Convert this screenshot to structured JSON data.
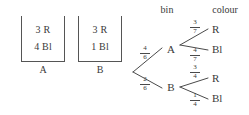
{
  "figure": {
    "type": "probability-tree-with-bins",
    "background": "#ffffff",
    "ink": "#3a3a3a"
  },
  "bins": [
    {
      "id": "A",
      "label": "A",
      "red": "3 R",
      "blue": "4 Bl"
    },
    {
      "id": "B",
      "label": "B",
      "red": "3 R",
      "blue": "1 Bl"
    }
  ],
  "tree": {
    "headers": {
      "stage1": "bin",
      "stage2": "colour"
    },
    "stage1": [
      {
        "node": "A",
        "probability": {
          "numerator": "4",
          "denominator": "6"
        },
        "stage2": [
          {
            "leaf": "R",
            "probability": {
              "numerator": "3",
              "denominator": "7"
            }
          },
          {
            "leaf": "Bl",
            "probability": {
              "numerator": "4",
              "denominator": "7"
            }
          }
        ]
      },
      {
        "node": "B",
        "probability": {
          "numerator": "2",
          "denominator": "6"
        },
        "stage2": [
          {
            "leaf": "R",
            "probability": {
              "numerator": "3",
              "denominator": "4"
            }
          },
          {
            "leaf": "Bl",
            "probability": {
              "numerator": "1",
              "denominator": "4"
            }
          }
        ]
      }
    ]
  }
}
